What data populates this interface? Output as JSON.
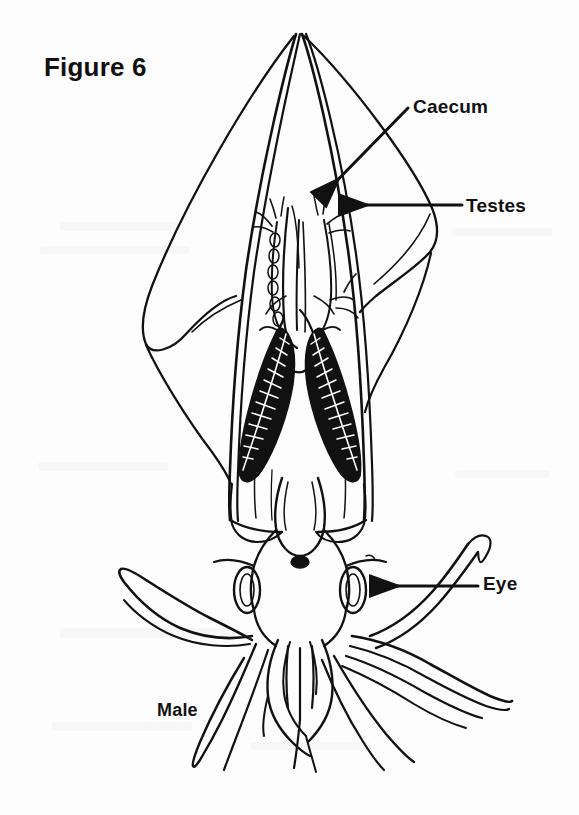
{
  "figure": {
    "title": "Figure 6",
    "caption": "Male",
    "background_color": "#fdfdfd",
    "ink_color": "#111111"
  },
  "annotations": [
    {
      "label": "Caecum",
      "arrow": "diagonal-down-left",
      "target": "caecum-organ"
    },
    {
      "label": "Testes",
      "arrow": "horizontal-left",
      "target": "testes-organ"
    },
    {
      "label": "Eye",
      "arrow": "horizontal-left",
      "target": "right-eye"
    }
  ],
  "labels": {
    "caecum": "Caecum",
    "testes": "Testes",
    "eye": "Eye",
    "male": "Male"
  }
}
